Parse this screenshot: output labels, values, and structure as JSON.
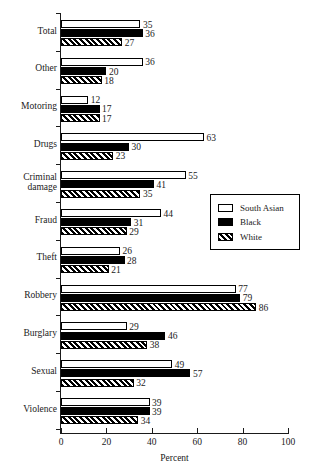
{
  "chart_data": {
    "type": "bar",
    "orientation": "horizontal",
    "title": "",
    "xlabel": "Percent",
    "ylabel": "",
    "xlim": [
      0,
      100
    ],
    "xticks": [
      0,
      20,
      40,
      60,
      80,
      100
    ],
    "grid": false,
    "legend_position": "center-right",
    "categories": [
      "Total",
      "Other",
      "Motoring",
      "Criminal\ndamage",
      "Drugs",
      "Fraud",
      "Theft",
      "Robbery",
      "Burglary",
      "Sexual",
      "Violence"
    ],
    "categories_display_order": [
      "Total",
      "Other",
      "Motoring",
      "Drugs",
      "Criminal damage",
      "Fraud",
      "Theft",
      "Robbery",
      "Burglary",
      "Sexual",
      "Violence"
    ],
    "series": [
      {
        "name": "South Asian",
        "fill": "white",
        "values": [
          35,
          36,
          12,
          63,
          55,
          44,
          26,
          77,
          29,
          49,
          39
        ]
      },
      {
        "name": "Black",
        "fill": "solid-black",
        "values": [
          36,
          20,
          17,
          30,
          41,
          31,
          28,
          79,
          46,
          57,
          39
        ]
      },
      {
        "name": "White",
        "fill": "diagonal-hatch",
        "values": [
          27,
          18,
          17,
          23,
          35,
          29,
          21,
          86,
          38,
          32,
          34
        ]
      }
    ],
    "groups": [
      {
        "label": "Total",
        "label_lines": [
          "Total"
        ],
        "values": [
          35,
          36,
          27
        ]
      },
      {
        "label": "Other",
        "label_lines": [
          "Other"
        ],
        "values": [
          36,
          20,
          18
        ]
      },
      {
        "label": "Motoring",
        "label_lines": [
          "Motoring"
        ],
        "values": [
          12,
          17,
          17
        ]
      },
      {
        "label": "Drugs",
        "label_lines": [
          "Drugs"
        ],
        "values": [
          63,
          30,
          23
        ]
      },
      {
        "label": "Criminal damage",
        "label_lines": [
          "Criminal",
          "damage"
        ],
        "values": [
          55,
          41,
          35
        ]
      },
      {
        "label": "Fraud",
        "label_lines": [
          "Fraud"
        ],
        "values": [
          44,
          31,
          29
        ]
      },
      {
        "label": "Theft",
        "label_lines": [
          "Theft"
        ],
        "values": [
          26,
          28,
          21
        ]
      },
      {
        "label": "Robbery",
        "label_lines": [
          "Robbery"
        ],
        "values": [
          77,
          79,
          86
        ]
      },
      {
        "label": "Burglary",
        "label_lines": [
          "Burglary"
        ],
        "values": [
          29,
          46,
          38
        ]
      },
      {
        "label": "Sexual",
        "label_lines": [
          "Sexual"
        ],
        "values": [
          49,
          57,
          32
        ]
      },
      {
        "label": "Violence",
        "label_lines": [
          "Violence"
        ],
        "values": [
          39,
          39,
          34
        ]
      }
    ],
    "colors": {
      "axis": "#1a1a1a",
      "bar_outline": "#000000",
      "series_south_asian": "#ffffff",
      "series_black": "#000000",
      "series_white_hatch": "#000000",
      "background": "#ffffff"
    }
  },
  "legend": {
    "items": [
      {
        "label": "South Asian",
        "swatch": "white-rect-icon"
      },
      {
        "label": "Black",
        "swatch": "black-rect-icon"
      },
      {
        "label": "White",
        "swatch": "hatched-rect-icon"
      }
    ]
  },
  "axis": {
    "x_title": "Percent",
    "x_tick_labels": [
      "0",
      "20",
      "40",
      "60",
      "80",
      "100"
    ]
  }
}
